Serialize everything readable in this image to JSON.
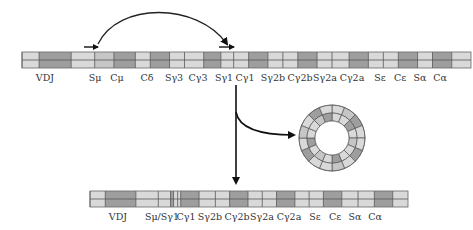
{
  "colors": {
    "light": "#d9d9d9",
    "mid": "#c6c6c6",
    "dark": "#9e9e9e",
    "line": "#555555",
    "arrow": "#111111"
  },
  "top_chromosome": {
    "x": 22,
    "y": 52,
    "width": 449,
    "height": 16,
    "segments": [
      {
        "w": 16,
        "tone": "light"
      },
      {
        "w": 30,
        "tone": "dark"
      },
      {
        "w": 22,
        "tone": "light"
      },
      {
        "w": 18,
        "tone": "mid"
      },
      {
        "w": 20,
        "tone": "dark"
      },
      {
        "w": 14,
        "tone": "light"
      },
      {
        "w": 18,
        "tone": "dark"
      },
      {
        "w": 14,
        "tone": "light"
      },
      {
        "w": 18,
        "tone": "light"
      },
      {
        "w": 16,
        "tone": "dark"
      },
      {
        "w": 12,
        "tone": "light"
      },
      {
        "w": 14,
        "tone": "light"
      },
      {
        "w": 18,
        "tone": "dark"
      },
      {
        "w": 14,
        "tone": "light"
      },
      {
        "w": 14,
        "tone": "light"
      },
      {
        "w": 18,
        "tone": "dark"
      },
      {
        "w": 14,
        "tone": "light"
      },
      {
        "w": 16,
        "tone": "light"
      },
      {
        "w": 18,
        "tone": "dark"
      },
      {
        "w": 14,
        "tone": "light"
      },
      {
        "w": 14,
        "tone": "light"
      },
      {
        "w": 18,
        "tone": "dark"
      },
      {
        "w": 14,
        "tone": "light"
      },
      {
        "w": 18,
        "tone": "dark"
      },
      {
        "w": 18,
        "tone": "light"
      }
    ],
    "labels": [
      {
        "text": "VDJ",
        "x": 45
      },
      {
        "text": "Sμ",
        "x": 95
      },
      {
        "text": "Cμ",
        "x": 117
      },
      {
        "text": "Cδ",
        "x": 147
      },
      {
        "text": "Sγ3",
        "x": 174
      },
      {
        "text": "Cγ3",
        "x": 198
      },
      {
        "text": "Sγ1",
        "x": 224
      },
      {
        "text": "Cγ1",
        "x": 245
      },
      {
        "text": "Sγ2b",
        "x": 273
      },
      {
        "text": "Cγ2b",
        "x": 300
      },
      {
        "text": "Sγ2a",
        "x": 325
      },
      {
        "text": "Cγ2a",
        "x": 352
      },
      {
        "text": "Sε",
        "x": 380
      },
      {
        "text": "Cε",
        "x": 400
      },
      {
        "text": "Sα",
        "x": 420
      },
      {
        "text": "Cα",
        "x": 440
      }
    ],
    "label_y": 81
  },
  "bottom_chromosome": {
    "x": 90,
    "y": 191,
    "width": 318,
    "height": 16,
    "segments": [
      {
        "w": 15,
        "tone": "light"
      },
      {
        "w": 30,
        "tone": "dark"
      },
      {
        "w": 22,
        "tone": "light"
      },
      {
        "w": 12,
        "tone": "light"
      },
      {
        "w": 3,
        "tone": "dark"
      },
      {
        "w": 4,
        "tone": "light"
      },
      {
        "w": 3,
        "tone": "light"
      },
      {
        "w": 18,
        "tone": "dark"
      },
      {
        "w": 16,
        "tone": "light"
      },
      {
        "w": 14,
        "tone": "light"
      },
      {
        "w": 18,
        "tone": "dark"
      },
      {
        "w": 14,
        "tone": "light"
      },
      {
        "w": 14,
        "tone": "light"
      },
      {
        "w": 18,
        "tone": "dark"
      },
      {
        "w": 14,
        "tone": "light"
      },
      {
        "w": 14,
        "tone": "light"
      },
      {
        "w": 18,
        "tone": "dark"
      },
      {
        "w": 16,
        "tone": "light"
      },
      {
        "w": 16,
        "tone": "light"
      },
      {
        "w": 18,
        "tone": "dark"
      },
      {
        "w": 15,
        "tone": "light"
      }
    ],
    "labels": [
      {
        "text": "VDJ",
        "x": 118
      },
      {
        "text": "Sμ/Sγ1",
        "x": 162
      },
      {
        "text": "Cγ1",
        "x": 186
      },
      {
        "text": "Sγ2b",
        "x": 210
      },
      {
        "text": "Cγ2b",
        "x": 237
      },
      {
        "text": "Sγ2a",
        "x": 262
      },
      {
        "text": "Cγ2a",
        "x": 289
      },
      {
        "text": "Sε",
        "x": 315
      },
      {
        "text": "Cε",
        "x": 335
      },
      {
        "text": "Sα",
        "x": 355
      },
      {
        "text": "Cα",
        "x": 375
      }
    ],
    "label_y": 220
  },
  "excision_circle": {
    "cx": 332,
    "cy": 138,
    "r_outer": 33,
    "r_mid": 25,
    "r_mid2": 20,
    "r_inner": 17,
    "segments": 16
  },
  "arrows": {
    "switch_arc": {
      "from_x": 98,
      "to_x": 227,
      "base_y": 44,
      "peak_y": 16
    },
    "small_left": {
      "x1": 84,
      "x2": 98,
      "y": 47
    },
    "small_right": {
      "x1": 219,
      "x2": 234,
      "y": 47
    },
    "down_arrow": {
      "x": 236,
      "y1": 85,
      "y2": 183
    },
    "branch_arrow": {
      "x": 236,
      "y": 112,
      "to_x": 294,
      "to_y": 135
    }
  }
}
